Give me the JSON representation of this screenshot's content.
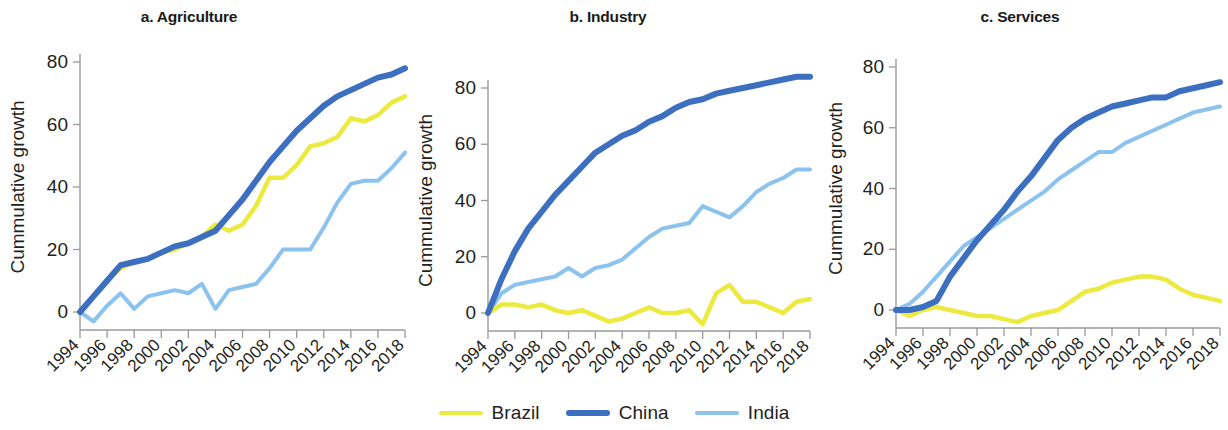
{
  "figure": {
    "y_axis_title": "Cummulative growth",
    "series_colors": {
      "Brazil": "#ecea3e",
      "China": "#3d6fc0",
      "India": "#8cc2ee"
    },
    "legend": {
      "position": "bottom-center",
      "items": [
        {
          "label": "Brazil",
          "color": "#ecea3e",
          "width": 4.5
        },
        {
          "label": "China",
          "color": "#3d6fc0",
          "width": 6.5
        },
        {
          "label": "India",
          "color": "#8cc2ee",
          "width": 4.5
        }
      ]
    }
  },
  "chart_data": [
    {
      "type": "line",
      "title": "a. Agriculture",
      "xlabel": "",
      "ylabel": "Cummulative growth",
      "grid": false,
      "xlim": [
        1994,
        2018
      ],
      "ylim": [
        -6,
        84
      ],
      "yticks": [
        0,
        20,
        40,
        60,
        80
      ],
      "xticks": [
        1994,
        1996,
        1998,
        2000,
        2002,
        2004,
        2006,
        2008,
        2010,
        2012,
        2014,
        2016,
        2018
      ],
      "x": [
        1994,
        1995,
        1996,
        1997,
        1998,
        1999,
        2000,
        2001,
        2002,
        2003,
        2004,
        2005,
        2006,
        2007,
        2008,
        2009,
        2010,
        2011,
        2012,
        2013,
        2014,
        2015,
        2016,
        2017,
        2018
      ],
      "series": [
        {
          "name": "Brazil",
          "color": "#ecea3e",
          "values": [
            0,
            5,
            10,
            14,
            16,
            17,
            19,
            20,
            22,
            24,
            28,
            26,
            28,
            34,
            43,
            43,
            47,
            53,
            54,
            56,
            62,
            61,
            63,
            67,
            69
          ]
        },
        {
          "name": "China",
          "color": "#3d6fc0",
          "values": [
            0,
            5,
            10,
            15,
            16,
            17,
            19,
            21,
            22,
            24,
            26,
            31,
            36,
            42,
            48,
            53,
            58,
            62,
            66,
            69,
            71,
            73,
            75,
            76,
            78
          ]
        },
        {
          "name": "India",
          "color": "#8cc2ee",
          "values": [
            0,
            -3,
            2,
            6,
            1,
            5,
            6,
            7,
            6,
            9,
            1,
            7,
            8,
            9,
            14,
            20,
            20,
            20,
            27,
            35,
            41,
            42,
            42,
            46,
            51
          ]
        }
      ]
    },
    {
      "type": "line",
      "title": "b. Industry",
      "xlabel": "",
      "ylabel": "Cummulative growth",
      "grid": false,
      "xlim": [
        1994,
        2018
      ],
      "ylim": [
        -7,
        90
      ],
      "yticks": [
        0,
        20,
        40,
        60,
        80
      ],
      "xticks": [
        1994,
        1996,
        1998,
        2000,
        2002,
        2004,
        2006,
        2008,
        2010,
        2012,
        2014,
        2016,
        2018
      ],
      "x": [
        1994,
        1995,
        1996,
        1997,
        1998,
        1999,
        2000,
        2001,
        2002,
        2003,
        2004,
        2005,
        2006,
        2007,
        2008,
        2009,
        2010,
        2011,
        2012,
        2013,
        2014,
        2015,
        2016,
        2017,
        2018
      ],
      "series": [
        {
          "name": "Brazil",
          "color": "#ecea3e",
          "values": [
            0,
            3,
            3,
            2,
            3,
            1,
            0,
            1,
            -1,
            -3,
            -2,
            0,
            2,
            0,
            0,
            1,
            -4,
            7,
            10,
            4,
            4,
            2,
            0,
            4,
            5
          ]
        },
        {
          "name": "China",
          "color": "#3d6fc0",
          "values": [
            0,
            12,
            22,
            30,
            36,
            42,
            47,
            52,
            57,
            60,
            63,
            65,
            68,
            70,
            73,
            75,
            76,
            78,
            79,
            80,
            81,
            82,
            83,
            84,
            84
          ]
        },
        {
          "name": "India",
          "color": "#8cc2ee",
          "values": [
            0,
            7,
            10,
            11,
            12,
            13,
            16,
            13,
            16,
            17,
            19,
            23,
            27,
            30,
            31,
            32,
            38,
            36,
            34,
            38,
            43,
            46,
            48,
            51,
            51
          ]
        }
      ]
    },
    {
      "type": "line",
      "title": "c. Services",
      "xlabel": "",
      "ylabel": "Cummulative growth",
      "grid": false,
      "xlim": [
        1994,
        2018
      ],
      "ylim": [
        -7,
        84
      ],
      "yticks": [
        0,
        20,
        40,
        60,
        80
      ],
      "xticks": [
        1994,
        1996,
        1998,
        2000,
        2002,
        2004,
        2006,
        2008,
        2010,
        2012,
        2014,
        2016,
        2018
      ],
      "x": [
        1994,
        1995,
        1996,
        1997,
        1998,
        1999,
        2000,
        2001,
        2002,
        2003,
        2004,
        2005,
        2006,
        2007,
        2008,
        2009,
        2010,
        2011,
        2012,
        2013,
        2014,
        2015,
        2016,
        2017,
        2018
      ],
      "series": [
        {
          "name": "Brazil",
          "color": "#ecea3e",
          "values": [
            0,
            -2,
            0,
            1,
            0,
            -1,
            -2,
            -2,
            -3,
            -4,
            -2,
            -1,
            0,
            3,
            6,
            7,
            9,
            10,
            11,
            11,
            10,
            7,
            5,
            4,
            3
          ]
        },
        {
          "name": "China",
          "color": "#3d6fc0",
          "values": [
            0,
            0,
            1,
            3,
            11,
            17,
            23,
            28,
            33,
            39,
            44,
            50,
            56,
            60,
            63,
            65,
            67,
            68,
            69,
            70,
            70,
            72,
            73,
            74,
            75
          ]
        },
        {
          "name": "India",
          "color": "#8cc2ee",
          "values": [
            0,
            2,
            6,
            11,
            16,
            21,
            24,
            27,
            30,
            33,
            36,
            39,
            43,
            46,
            49,
            52,
            52,
            55,
            57,
            59,
            61,
            63,
            65,
            66,
            67
          ]
        }
      ]
    }
  ]
}
